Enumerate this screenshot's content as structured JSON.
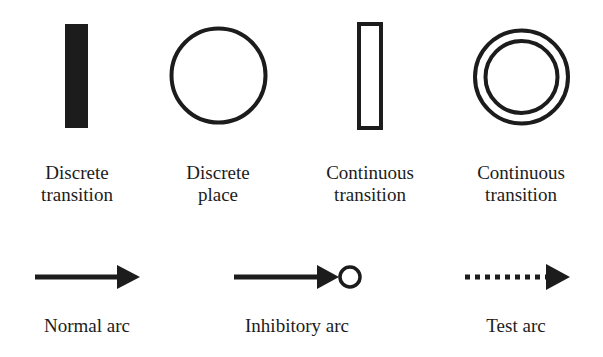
{
  "diagram": {
    "colors": {
      "stroke": "#1c1c1c",
      "background": "#ffffff"
    },
    "elements": [
      {
        "id": "discrete-transition",
        "shape": "filled-bar",
        "label_line1": "Discrete",
        "label_line2": "transition"
      },
      {
        "id": "discrete-place",
        "shape": "circle",
        "label_line1": "Discrete",
        "label_line2": "place"
      },
      {
        "id": "continuous-transition",
        "shape": "hollow-bar",
        "label_line1": "Continuous",
        "label_line2": "transition"
      },
      {
        "id": "continuous-place",
        "shape": "double-circle",
        "label_line1": "Continuous",
        "label_line2": "transition"
      }
    ],
    "arcs": [
      {
        "id": "normal-arc",
        "style": "solid-arrow",
        "label": "Normal arc"
      },
      {
        "id": "inhibitory-arc",
        "style": "solid-arrow-with-circle",
        "label": "Inhibitory arc"
      },
      {
        "id": "test-arc",
        "style": "dotted-arrow",
        "label": "Test arc"
      }
    ]
  }
}
